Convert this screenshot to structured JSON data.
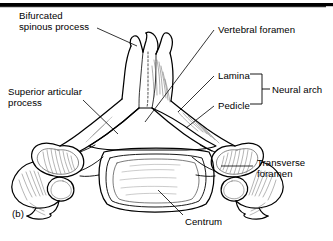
{
  "figure": {
    "panel_label": "(b)",
    "style": {
      "line_color": "#000000",
      "background": "#ffffff",
      "shading_color": "#555555",
      "rule_color": "#000000"
    }
  },
  "labels": {
    "bifurcated_spinous_process": "Bifurcated\nspinous process",
    "superior_articular_process": "Superior articular\nprocess",
    "vertebral_foramen": "Vertebral foramen",
    "lamina": "Lamina",
    "pedicle": "Pedicle",
    "neural_arch": "Neural arch",
    "transverse_foramen": "Transverse\nforamen",
    "centrum": "Centrum"
  },
  "bracket": {
    "groups": [
      "Lamina",
      "Pedicle"
    ],
    "group_name": "Neural arch"
  },
  "anatomy_parts": [
    "bifurcated spinous process",
    "vertebral foramen",
    "lamina",
    "pedicle",
    "superior articular process",
    "transverse foramen",
    "centrum"
  ]
}
